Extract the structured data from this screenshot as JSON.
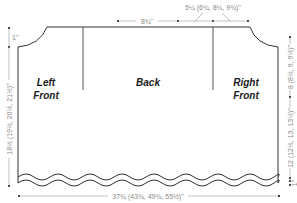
{
  "diagram": {
    "type": "knitting-schematic",
    "pieces": {
      "left_front": [
        "Left",
        "Front"
      ],
      "back": "Back",
      "right_front": [
        "Right",
        "Front"
      ]
    },
    "measurements": {
      "back_neck": "8¾\"",
      "shoulder": "5¼ (6¾, 8¼, 9¾)\"",
      "neck_drop": "1\"",
      "total_length": "18½ (19½, 20½, 21½)\"",
      "armhole_depth": "8 (8½, 9, 9½)\"",
      "body_length": "12 (12½, 13, 13½)\"",
      "hem": "1\"",
      "width": "37¾ (43¾, 49¾, 55½)\""
    },
    "colors": {
      "outline": "#333333",
      "dimension": "#8a8a8a",
      "label": "#1a1a1a"
    }
  }
}
